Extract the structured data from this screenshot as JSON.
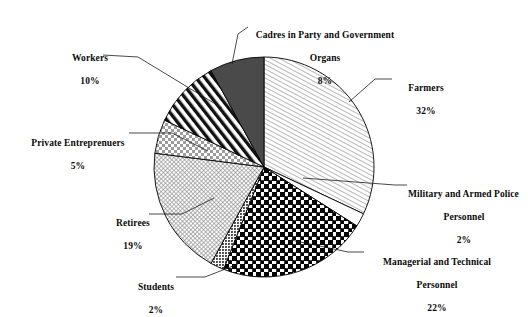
{
  "chart_data": {
    "type": "pie",
    "title": "",
    "subtitle": "",
    "xlabel": "",
    "ylabel": "",
    "legend_position": "none",
    "grid": false,
    "units": "percent",
    "total": 100,
    "start_angle_deg": 0,
    "direction": "clockwise",
    "categories": [
      "Farmers",
      "Military and Armed Police Personnel",
      "Managerial and Technical Personnel",
      "Students",
      "Retirees",
      "Private Entreprenuers",
      "Workers",
      "Cadres in Party and Government Organs"
    ],
    "values": [
      32,
      2,
      22,
      2,
      19,
      5,
      10,
      8
    ],
    "slices": [
      {
        "key": "farmers",
        "label": "Farmers",
        "value": 32,
        "value_text": "32%",
        "fill": "hatch-fine-diagonal",
        "color": "#ffffff",
        "stroke": "#000000"
      },
      {
        "key": "military-and-armed-police-personnel",
        "label_line1": "Military and Armed Police",
        "label_line2": "Personnel",
        "label": "Military and Armed Police Personnel",
        "value": 2,
        "value_text": "2%",
        "fill": "solid-white",
        "color": "#ffffff",
        "stroke": "#000000"
      },
      {
        "key": "managerial-and-technical-personnel",
        "label_line1": "Managerial and Technical",
        "label_line2": "Personnel",
        "label": "Managerial and Technical Personnel",
        "value": 22,
        "value_text": "22%",
        "fill": "checker-bold",
        "color": "#000000",
        "stroke": "#000000"
      },
      {
        "key": "students",
        "label": "Students",
        "value": 2,
        "value_text": "2%",
        "fill": "dots-dense",
        "color": "#555555",
        "stroke": "#000000"
      },
      {
        "key": "retirees",
        "label": "Retirees",
        "value": 19,
        "value_text": "19%",
        "fill": "crosshatch-fine",
        "color": "#8a8a8a",
        "stroke": "#000000"
      },
      {
        "key": "private-entreprenuers",
        "label": "Private Entreprenuers",
        "value": 5,
        "value_text": "5%",
        "fill": "checker-light",
        "color": "#b5b5b5",
        "stroke": "#000000"
      },
      {
        "key": "workers",
        "label": "Workers",
        "value": 10,
        "value_text": "10%",
        "fill": "stripe-bold-diagonal",
        "color": "#000000",
        "stroke": "#000000"
      },
      {
        "key": "cadres-in-party-and-government-organs",
        "label_line1": "Cadres in Party and Government",
        "label_line2": "Organs",
        "label": "Cadres in Party and Government Organs",
        "value": 8,
        "value_text": "8%",
        "fill": "solid-dark-gray",
        "color": "#4a4a4a",
        "stroke": "#000000"
      }
    ]
  },
  "labels": {
    "workers": {
      "name": "Workers",
      "pct": "10%"
    },
    "private": {
      "name": "Private Entreprenuers",
      "pct": "5%"
    },
    "retirees": {
      "name": "Retirees",
      "pct": "19%"
    },
    "students": {
      "name": "Students",
      "pct": "2%"
    },
    "cadres": {
      "name": "Cadres in Party and Government",
      "name2": "Organs",
      "pct": "8%"
    },
    "farmers": {
      "name": "Farmers",
      "pct": "32%"
    },
    "military": {
      "name": "Military and Armed Police",
      "name2": "Personnel",
      "pct": "2%"
    },
    "managerial": {
      "name": "Managerial and Technical",
      "name2": "Personnel",
      "pct": "22%"
    }
  },
  "colors": {
    "background": "#ffffff",
    "ink": "#0a0a0a",
    "outline": "#000000",
    "cadres_fill": "#4a4a4a"
  }
}
